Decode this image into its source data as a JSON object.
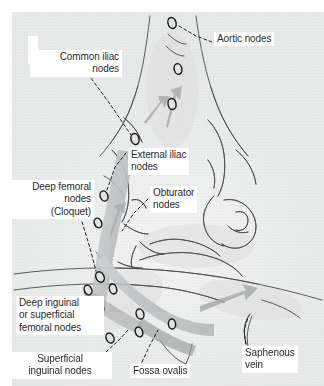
{
  "figure": {
    "type": "anatomical-illustration",
    "palette": {
      "plate_background": "#e9eaea",
      "label_background": "#ffffff",
      "label_text": "#2b2b2b",
      "ink_line": "#3a3a3a",
      "node_outline": "#1d1d1d",
      "lymph_vessel": "#b9bbbd",
      "arrow_gray": "#a9abad"
    }
  },
  "labels": {
    "aortic": "Aortic nodes",
    "common_iliac": "Common iliac\nnodes",
    "external_iliac": "External iliac\nnodes",
    "obturator": "Obturator\nnodes",
    "deep_femoral": "Deep femoral\nnodes\n(Cloquet)",
    "deep_inguinal": "Deep inguinal\nor superficial\nfemoral nodes",
    "superficial_inguinal": "Superficial\ninguinal nodes",
    "fossa_ovalis": "Fossa ovalis",
    "saphenous_vein": "Saphenous\nvein"
  },
  "nodes": [
    {
      "name": "aortic-node",
      "cx": 172,
      "cy": 23,
      "rx": 4.0,
      "ry": 5.6,
      "rot": -18
    },
    {
      "name": "common-iliac-node-upper",
      "cx": 178,
      "cy": 69,
      "rx": 3.8,
      "ry": 5.4,
      "rot": -12
    },
    {
      "name": "common-iliac-node-lower",
      "cx": 172,
      "cy": 104,
      "rx": 4.0,
      "ry": 5.6,
      "rot": -10
    },
    {
      "name": "common-iliac-node-left",
      "cx": 135,
      "cy": 139,
      "rx": 4.0,
      "ry": 5.6,
      "rot": -14
    },
    {
      "name": "external-iliac-node",
      "cx": 104,
      "cy": 196,
      "rx": 3.8,
      "ry": 5.2,
      "rot": -20
    },
    {
      "name": "external-iliac-node-2",
      "cx": 98,
      "cy": 223,
      "rx": 3.6,
      "ry": 5.0,
      "rot": -22
    },
    {
      "name": "deep-femoral-node",
      "cx": 100,
      "cy": 277,
      "rx": 4.0,
      "ry": 5.4,
      "rot": -26
    },
    {
      "name": "deep-femoral-node-2",
      "cx": 88,
      "cy": 290,
      "rx": 3.6,
      "ry": 5.0,
      "rot": -24
    },
    {
      "name": "deep-inguinal-node",
      "cx": 113,
      "cy": 289,
      "rx": 3.6,
      "ry": 5.0,
      "rot": -18
    },
    {
      "name": "deep-inguinal-node-2",
      "cx": 100,
      "cy": 308,
      "rx": 3.6,
      "ry": 5.0,
      "rot": -22
    },
    {
      "name": "superficial-inguinal-node",
      "cx": 140,
      "cy": 314,
      "rx": 3.8,
      "ry": 5.2,
      "rot": -16
    },
    {
      "name": "superficial-inguinal-node-2",
      "cx": 139,
      "cy": 332,
      "rx": 3.6,
      "ry": 5.0,
      "rot": -20
    },
    {
      "name": "fossa-ovalis-node",
      "cx": 110,
      "cy": 338,
      "rx": 3.8,
      "ry": 5.2,
      "rot": -24
    },
    {
      "name": "saphenous-opening-node",
      "cx": 172,
      "cy": 324,
      "rx": 3.6,
      "ry": 5.0,
      "rot": -6
    }
  ],
  "leaders": [
    {
      "name": "leader-aortic",
      "points": "179,26 196,36 212,42"
    },
    {
      "name": "leader-common-iliac",
      "points": "88,74 110,104 131,135"
    },
    {
      "name": "leader-external-iliac",
      "points": "126,153 115,167 107,190"
    },
    {
      "name": "leader-obturator",
      "points": "148,199 134,213 122,231"
    },
    {
      "name": "leader-deep-femoral",
      "points": "82,222 90,248 96,271"
    },
    {
      "name": "leader-deep-inguinal",
      "points": "84,292 90,300 95,306"
    },
    {
      "name": "leader-superficial-inguinal",
      "points": "106,352 120,339 128,330"
    },
    {
      "name": "leader-fossa-ovalis",
      "points": "142,362 150,345 158,330"
    },
    {
      "name": "leader-saphenous",
      "points": "246,344 244,330 248,318"
    }
  ]
}
